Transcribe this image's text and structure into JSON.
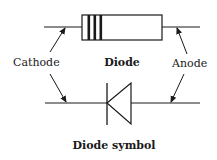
{
  "diagram": {
    "labels": {
      "cathode": "Cathode",
      "anode": "Anode",
      "diode": "Diode",
      "diode_symbol": "Diode symbol"
    },
    "colors": {
      "stroke": "#1a1a1a",
      "background": "#ffffff"
    },
    "components": [
      {
        "name": "physical-diode",
        "bands": 3
      },
      {
        "name": "schematic-symbol",
        "shape": "triangle-with-bar"
      }
    ]
  }
}
